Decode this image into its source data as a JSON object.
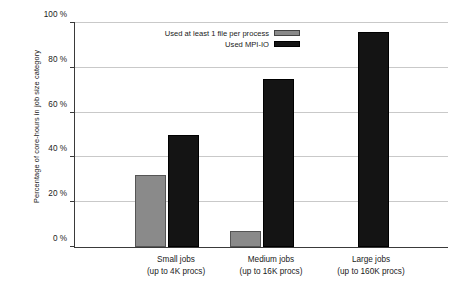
{
  "chart_data": {
    "type": "bar",
    "title": "",
    "xlabel": "",
    "ylabel": "Percentage of core-hours in job size category",
    "ylim": [
      0,
      100
    ],
    "yticks": [
      "0 %",
      "20 %",
      "40 %",
      "60 %",
      "80 %",
      "100 %"
    ],
    "ytick_values": [
      0,
      20,
      40,
      60,
      80,
      100
    ],
    "grid": "horizontal",
    "legend_position": "top-right-inside",
    "categories": [
      {
        "line1": "Small jobs",
        "line2": "(up to 4K procs)"
      },
      {
        "line1": "Medium jobs",
        "line2": "(up to 16K procs)"
      },
      {
        "line1": "Large jobs",
        "line2": "(up to 160K procs)"
      }
    ],
    "series": [
      {
        "name": "Used at least 1 file per process",
        "color": "#8a8a8a",
        "values": [
          32,
          7,
          0
        ]
      },
      {
        "name": "Used MPI-IO",
        "color": "#141414",
        "values": [
          50,
          75,
          96
        ]
      }
    ]
  }
}
